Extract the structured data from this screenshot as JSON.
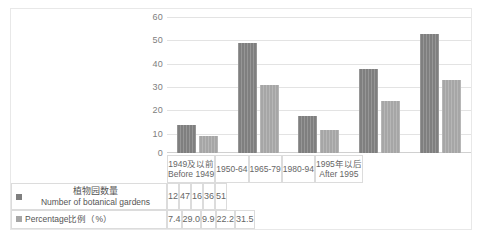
{
  "chart_data": {
    "type": "bar",
    "title": "",
    "xlabel": "",
    "ylabel": "",
    "ylim": [
      0,
      60
    ],
    "yticks": [
      0,
      10,
      20,
      30,
      40,
      50,
      60
    ],
    "grid": true,
    "legend_position": "table-below",
    "categories": [
      "1949及以前\nBefore 1949",
      "1950-64",
      "1965-79",
      "1980-94",
      "1995年以后\nAfter 1995"
    ],
    "series": [
      {
        "name": "植物园数量 Number of botanical gardens",
        "values": [
          12,
          47,
          16,
          36,
          51
        ],
        "color": "#7f7f7f"
      },
      {
        "name": "Percentage比例（%）",
        "values": [
          7.4,
          29.0,
          9.9,
          22.2,
          31.5
        ],
        "color": "#a6a6a6"
      }
    ]
  },
  "axis": {
    "y_ticks": [
      "0",
      "10",
      "20",
      "30",
      "40",
      "50",
      "60"
    ]
  },
  "categories": [
    {
      "cn": "1949及以前",
      "en": "Before 1949"
    },
    {
      "cn": "1950-64",
      "en": ""
    },
    {
      "cn": "1965-79",
      "en": ""
    },
    {
      "cn": "1980-94",
      "en": ""
    },
    {
      "cn": "1995年以后",
      "en": "After 1995"
    }
  ],
  "table": {
    "row1": {
      "legend_cn": "植物园数量",
      "legend_en": "Number of botanical gardens",
      "values": [
        "12",
        "47",
        "16",
        "36",
        "51"
      ]
    },
    "row2": {
      "legend": "Percentage比例（%）",
      "values": [
        "7.4",
        "29.0",
        "9.9",
        "22.2",
        "31.5"
      ]
    }
  },
  "colors": {
    "series1": "#7f7f7f",
    "series2": "#a6a6a6",
    "grid": "#e3e3e3",
    "border": "#dcdcdc"
  }
}
